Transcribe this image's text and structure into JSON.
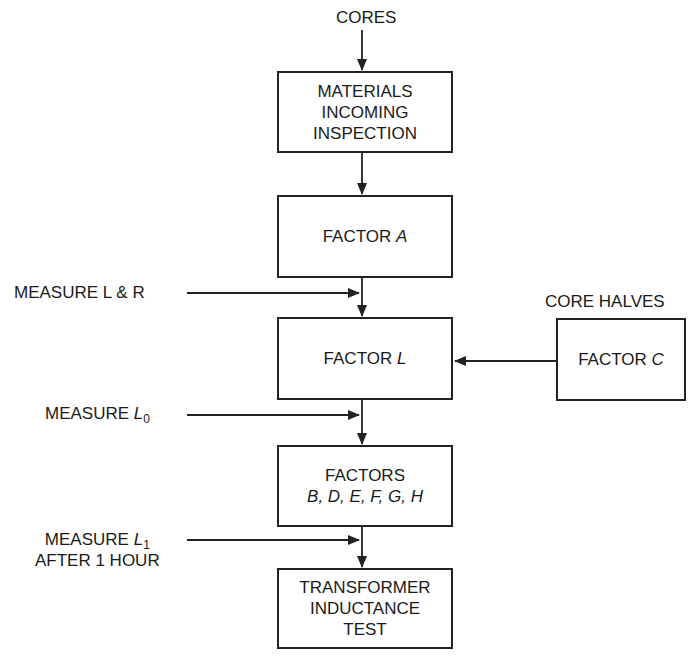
{
  "diagram": {
    "type": "process-flowchart",
    "inputs": {
      "top": "CORES",
      "side": "CORE HALVES"
    },
    "nodes": [
      {
        "id": "materials",
        "lines": [
          "MATERIALS",
          "INCOMING",
          "INSPECTION"
        ]
      },
      {
        "id": "factor_a",
        "prefix": "FACTOR ",
        "var": "A"
      },
      {
        "id": "factor_l",
        "prefix": "FACTOR ",
        "var": "L"
      },
      {
        "id": "factor_c",
        "prefix": "FACTOR ",
        "var": "C"
      },
      {
        "id": "factors_bh",
        "line1": "FACTORS",
        "line2": "B, D, E, F, G, H"
      },
      {
        "id": "test",
        "lines": [
          "TRANSFORMER",
          "INDUCTANCE",
          "TEST"
        ]
      }
    ],
    "measurements": [
      {
        "id": "m_lr",
        "text": "MEASURE L & R"
      },
      {
        "id": "m_l0",
        "prefix": "MEASURE ",
        "var": "L",
        "sub": "0"
      },
      {
        "id": "m_l1",
        "prefix": "MEASURE ",
        "var": "L",
        "sub": "1",
        "line2": "AFTER 1 HOUR"
      }
    ],
    "edges": [
      [
        "CORES",
        "materials"
      ],
      [
        "materials",
        "factor_a"
      ],
      [
        "factor_a",
        "factor_l"
      ],
      [
        "m_lr",
        "factor_a->factor_l"
      ],
      [
        "factor_c",
        "factor_l"
      ],
      [
        "factor_l",
        "factors_bh"
      ],
      [
        "m_l0",
        "factor_l->factors_bh"
      ],
      [
        "factors_bh",
        "test"
      ],
      [
        "m_l1",
        "factors_bh->test"
      ]
    ]
  },
  "colors": {
    "line": "#222222",
    "background": "#ffffff"
  }
}
